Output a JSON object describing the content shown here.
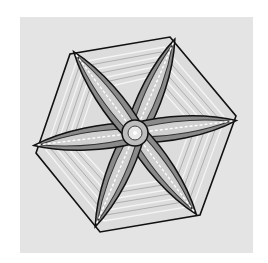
{
  "image": {
    "subject": "hexagonal plate snowflake with six broad arms",
    "background_color": "#ffffff",
    "photo_background_color": "#e4e4e4",
    "line_color": "#111111",
    "center": [
      135,
      133
    ],
    "hexagon_vertices": [
      [
        170,
        37
      ],
      [
        236,
        116
      ],
      [
        200,
        215
      ],
      [
        100,
        232
      ],
      [
        36,
        153
      ],
      [
        70,
        54
      ]
    ]
  }
}
